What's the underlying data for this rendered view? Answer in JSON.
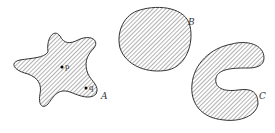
{
  "figure": {
    "regions": [
      {
        "id": "A",
        "label": "A",
        "shape": "star"
      },
      {
        "id": "B",
        "label": "B",
        "shape": "convex-blob"
      },
      {
        "id": "C",
        "label": "C",
        "shape": "crescent"
      }
    ],
    "points": [
      {
        "label": "p"
      },
      {
        "label": "q"
      }
    ],
    "colors": {
      "stroke": "#333333",
      "hatch": "#555555",
      "background": "#ffffff"
    }
  }
}
